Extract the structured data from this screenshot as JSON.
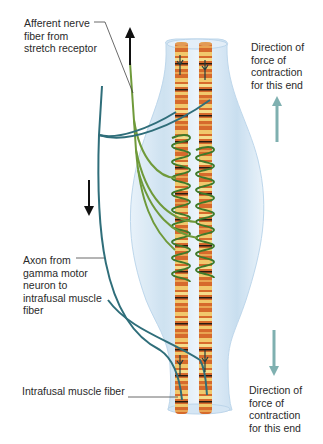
{
  "figure": {
    "labels": {
      "afferent": "Afferent nerve\nfiber from\nstretch receptor",
      "direction_top": "Direction of\nforce of\ncontraction\nfor this end",
      "axon": "Axon from\ngamma motor\nneuron to\nintrafusal muscle\nfiber",
      "intrafusal": "Intrafusal muscle fiber",
      "direction_bottom": "Direction of\nforce of\ncontraction\nfor this end"
    },
    "arrows": {
      "afferent_signal": "up",
      "gamma_signal": "down",
      "force_top": "up",
      "force_bottom": "down"
    },
    "colors": {
      "capsule": "#cfe3f2",
      "fiber_orange": "#d9692a",
      "fiber_stripe": "#f3d27a",
      "band_dark": "#2a1c12",
      "afferent_green": "#6f9a3a",
      "spiral_green": "#3f7a2a",
      "gamma_teal": "#2f6e7a",
      "force_arrow": "#7fb0b0"
    }
  }
}
